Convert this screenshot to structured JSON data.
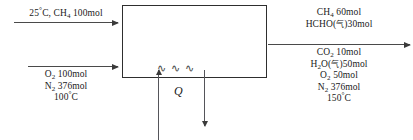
{
  "diagram": {
    "type": "process-flow-diagram",
    "title": "",
    "reactor": {
      "label": "",
      "heat_symbol": "Q",
      "heat_wave_glyph": "∿ ∿ ∿"
    },
    "inlet_streams": [
      {
        "id": "inlet-methane",
        "position": "above-arrow",
        "lines": [
          "25°C, CH₄ 100mol"
        ],
        "parts": [
          {
            "temperature": "25",
            "unit": "°C"
          },
          {
            "species": "CH",
            "sub": "4",
            "amount": "100mol"
          }
        ]
      },
      {
        "id": "inlet-air",
        "position": "below-arrow",
        "lines": [
          "O₂ 100mol",
          "N₂ 376mol",
          "100°C"
        ],
        "parts": [
          {
            "species": "O",
            "sub": "2",
            "amount": "100mol"
          },
          {
            "species": "N",
            "sub": "2",
            "amount": "376mol"
          },
          {
            "temperature": "100",
            "unit": "°C"
          }
        ]
      }
    ],
    "outlet_streams": [
      {
        "id": "outlet-top",
        "position": "above-arrow",
        "lines": [
          "CH₄ 60mol",
          "HCHO(气)30mol"
        ],
        "parts": [
          {
            "species": "CH",
            "sub": "4",
            "amount": "60mol"
          },
          {
            "species": "HCHO",
            "phase": "气",
            "amount": "30mol"
          }
        ]
      },
      {
        "id": "outlet-bottom",
        "position": "below-arrow",
        "lines": [
          "CO₂ 10mol",
          "H₂O(气)50mol",
          "O₂ 50mol",
          "N₂ 376mol",
          "150°C"
        ],
        "parts": [
          {
            "species": "CO",
            "sub": "2",
            "amount": "10mol"
          },
          {
            "species": "H",
            "sub": "2",
            "species2": "O",
            "phase": "气",
            "amount": "50mol"
          },
          {
            "species": "O",
            "sub": "2",
            "amount": "50mol"
          },
          {
            "species": "N",
            "sub": "2",
            "amount": "376mol"
          },
          {
            "temperature": "150",
            "unit": "°C"
          }
        ]
      }
    ],
    "colors": {
      "line": "#4a4a4a",
      "box_border": "#2e2e2e",
      "text": "#1a1a1a",
      "background": "#ffffff"
    }
  }
}
